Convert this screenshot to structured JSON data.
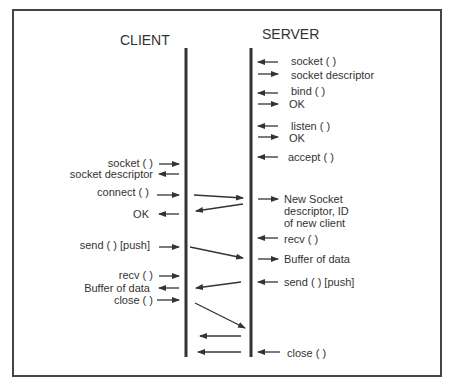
{
  "diagram": {
    "client_title": "CLIENT",
    "server_title": "SERVER",
    "server_calls": [
      {
        "text": "socket ( )",
        "y": 61,
        "dir": "in"
      },
      {
        "text": "socket descriptor",
        "y": 74,
        "dir": "out"
      },
      {
        "text": "bind ( )",
        "y": 91,
        "dir": "in"
      },
      {
        "text": "OK",
        "y": 103,
        "dir": "out"
      },
      {
        "text": "listen ( )",
        "y": 125,
        "dir": "in"
      },
      {
        "text": "OK",
        "y": 138,
        "dir": "out"
      },
      {
        "text": "accept ( )",
        "y": 157,
        "dir": "in"
      },
      {
        "text": "New Socket",
        "y": 198,
        "dir": "out"
      },
      {
        "text": "descriptor, ID",
        "y": 211
      },
      {
        "text": "of new client",
        "y": 223
      },
      {
        "text": "recv ( )",
        "y": 238,
        "dir": "in"
      },
      {
        "text": "Buffer of data",
        "y": 258,
        "dir": "out"
      },
      {
        "text": "send ( ) [push]",
        "y": 281,
        "dir": "in"
      },
      {
        "text": "close ( )",
        "y": 352,
        "dir": "in"
      }
    ],
    "client_calls": [
      {
        "text": "socket ( )",
        "y": 163,
        "dir": "in"
      },
      {
        "text": "socket descriptor",
        "y": 174,
        "dir": "out"
      },
      {
        "text": "connect ( )",
        "y": 191,
        "dir": "in"
      },
      {
        "text": "OK",
        "y": 213,
        "dir": "out"
      },
      {
        "text": "send ( ) [push]",
        "y": 244,
        "dir": "in"
      },
      {
        "text": "recv ( )",
        "y": 275,
        "dir": "in"
      },
      {
        "text": "Buffer of data",
        "y": 288,
        "dir": "out"
      },
      {
        "text": "close ( )",
        "y": 300,
        "dir": "in"
      }
    ],
    "messages": [
      {
        "from": "client",
        "to": "server",
        "label": "connect"
      },
      {
        "from": "server",
        "to": "client",
        "label": "OK"
      },
      {
        "from": "client",
        "to": "server",
        "label": "send data"
      },
      {
        "from": "server",
        "to": "client",
        "label": "send data"
      },
      {
        "from": "client",
        "to": "server",
        "label": "close"
      },
      {
        "from": "server",
        "to": "client",
        "label": "close ack"
      },
      {
        "from": "server",
        "to": "client",
        "label": "close"
      }
    ]
  }
}
